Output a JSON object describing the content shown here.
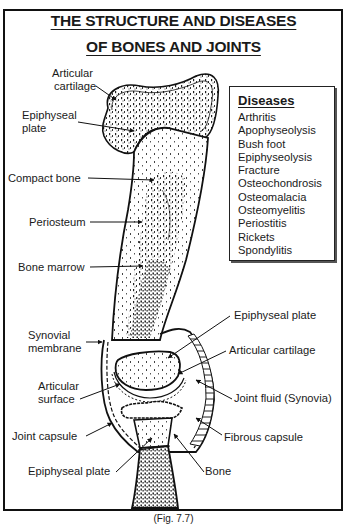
{
  "title": {
    "line1": "THE STRUCTURE AND DISEASES",
    "line2": "OF BONES AND JOINTS"
  },
  "labels": {
    "articular_cartilage_top": [
      "Articular",
      "cartilage"
    ],
    "epiphyseal_plate_top": [
      "Epiphyseal",
      "plate"
    ],
    "compact_bone": "Compact bone",
    "periosteum": "Periosteum",
    "bone_marrow": "Bone marrow",
    "synovial_membrane": [
      "Synovial",
      "membrane"
    ],
    "articular_surface": [
      "Articular",
      "surface"
    ],
    "joint_capsule": "Joint capsule",
    "epiphyseal_plate_bottom": "Epiphyseal plate",
    "epiphyseal_plate_right": "Epiphyseal plate",
    "articular_cartilage_right": "Articular cartilage",
    "joint_fluid": "Joint fluid (Synovia)",
    "fibrous_capsule": "Fibrous capsule",
    "bone": "Bone"
  },
  "diseases": {
    "heading": "Diseases",
    "items": [
      "Arthritis",
      "Apophyseolysis",
      "Bush foot",
      "Epiphyseolysis",
      "Fracture",
      "Osteochondrosis",
      "Osteomalacia",
      "Osteomyelitis",
      "Periostitis",
      "Rickets",
      "Spondylitis"
    ]
  },
  "caption": "(Fig. 7.7)"
}
